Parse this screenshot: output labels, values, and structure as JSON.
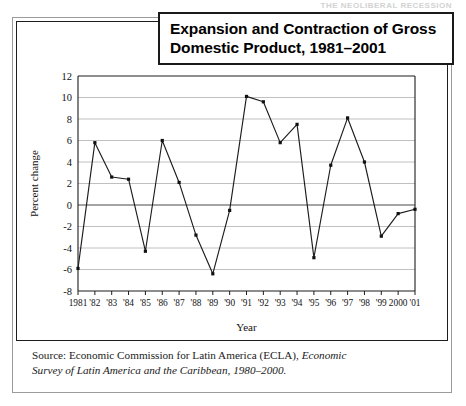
{
  "running_head": "THE NEOLIBERAL RECESSION",
  "title": {
    "line1": "Expansion and Contraction of Gross",
    "line2": "Domestic Product, 1981–2001"
  },
  "source": {
    "prefix": "Source: Economic Commission for Latin America (ECLA), ",
    "italic1": "Economic",
    "italic2": "Survey of Latin America and the Caribbean, 1980–2000."
  },
  "chart_data": {
    "type": "line",
    "title": "Expansion and Contraction of Gross Domestic Product, 1981–2001",
    "xlabel": "Year",
    "ylabel": "Percent change",
    "ylim": [
      -8,
      12
    ],
    "ytick_step": 2,
    "yticks": [
      12,
      10,
      8,
      6,
      4,
      2,
      0,
      -2,
      -4,
      -6,
      -8
    ],
    "grid": true,
    "legend": "none",
    "categories": [
      "1981",
      "'82",
      "'83",
      "'84",
      "'85",
      "'86",
      "'87",
      "'88",
      "'89",
      "'90",
      "'91",
      "'92",
      "'93",
      "'94",
      "'95",
      "'96",
      "'97",
      "'98",
      "'99",
      "2000",
      "'01"
    ],
    "values": [
      -5.9,
      5.8,
      2.6,
      2.4,
      -4.3,
      6.0,
      2.1,
      -2.8,
      -6.4,
      -0.5,
      10.1,
      9.6,
      5.8,
      7.5,
      -4.9,
      3.7,
      8.1,
      4.0,
      -2.9,
      -0.8,
      -0.4
    ],
    "marker": "square",
    "line_color": "#1d1d1d",
    "grid_color": "#b9b9b9"
  }
}
